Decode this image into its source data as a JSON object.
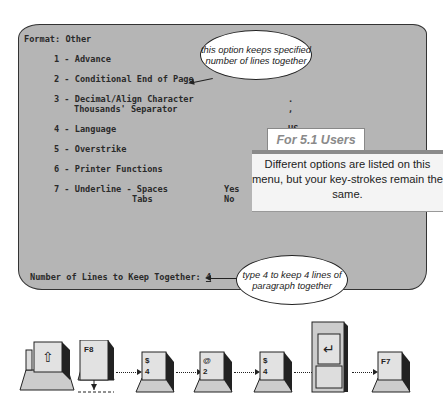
{
  "screen": {
    "header": "Format: Other",
    "menu": [
      {
        "num": "1",
        "label": "Advance",
        "value": ""
      },
      {
        "num": "2",
        "label": "Conditional End of Page",
        "value": ""
      },
      {
        "num": "3",
        "label": "Decimal/Align Character",
        "label2": "Thousands' Separator",
        "value": ".",
        "value2": ","
      },
      {
        "num": "4",
        "label": "Language",
        "value": "US"
      },
      {
        "num": "5",
        "label": "Overstrike",
        "value": ""
      },
      {
        "num": "6",
        "label": "Printer Functions",
        "value": ""
      },
      {
        "num": "7",
        "label": "Underline - Spaces",
        "label2": "Tabs",
        "value": "Yes",
        "value2": "No"
      }
    ],
    "prompt": "Number of Lines to Keep Together: ",
    "prompt_value": "4"
  },
  "callouts": {
    "top": "this option keeps specified number of lines together",
    "bottom": "type 4 to keep 4 lines of paragraph together"
  },
  "note": {
    "title": "For 5.1 Users",
    "body": "Different options are listed on this menu, but your key-strokes remain the same."
  },
  "keys": [
    {
      "name": "shift",
      "top": "⇧",
      "bottom": ""
    },
    {
      "name": "f8",
      "top": "F8",
      "bottom": ""
    },
    {
      "name": "4",
      "top": "$",
      "bottom": "4"
    },
    {
      "name": "2",
      "top": "@",
      "bottom": "2"
    },
    {
      "name": "4",
      "top": "$",
      "bottom": "4"
    },
    {
      "name": "enter",
      "top": "↵",
      "bottom": ""
    },
    {
      "name": "f7",
      "top": "F7",
      "bottom": ""
    }
  ]
}
